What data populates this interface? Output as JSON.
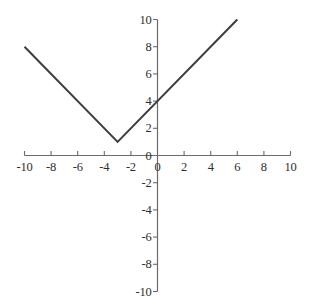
{
  "chart_data": {
    "type": "line",
    "title": "",
    "subtitle": "",
    "xlabel": "",
    "ylabel": "",
    "xlim": [
      -10,
      10
    ],
    "ylim": [
      -10,
      10
    ],
    "grid": false,
    "legend": null,
    "axis_style": "centered-cartesian",
    "x_ticks": [
      -10,
      -8,
      -6,
      -4,
      -2,
      0,
      2,
      4,
      6,
      8,
      10
    ],
    "y_ticks": [
      10,
      8,
      6,
      4,
      2,
      0,
      -2,
      -4,
      -6,
      -8,
      -10
    ],
    "x_tick_labels": [
      "-10",
      "-8",
      "-6",
      "-4",
      "-2",
      "0",
      "2",
      "4",
      "6",
      "8",
      "10"
    ],
    "y_tick_labels": [
      "10",
      "8",
      "6",
      "4",
      "2",
      "0",
      "-2",
      "-4",
      "-6",
      "-8",
      "-10"
    ],
    "series": [
      {
        "name": "y = |x + 3| + 1",
        "color": "#3d3d3d",
        "x": [
          -10,
          -3,
          6
        ],
        "values": [
          8,
          1,
          10
        ],
        "points": [
          {
            "x": -10,
            "y": 8
          },
          {
            "x": -3,
            "y": 1
          },
          {
            "x": 6,
            "y": 10
          }
        ],
        "vertex": {
          "x": -3,
          "y": 1
        },
        "y_intercept": 4,
        "left_slope": -1,
        "right_slope": 1
      }
    ],
    "annotations": []
  },
  "axes": {
    "x_axis_name": "x-axis",
    "y_axis_name": "y-axis",
    "axis_color": "#6b6b6b",
    "origin_label": "0"
  },
  "style": {
    "background": "#ffffff",
    "line_color": "#3d3d3d",
    "label_color": "#2e2e2e"
  }
}
